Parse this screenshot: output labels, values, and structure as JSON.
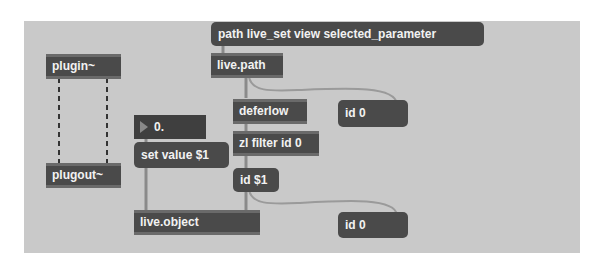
{
  "patcher": {
    "background": "#c9c9c9",
    "object_color": "#4a4a4a",
    "text_color": "#f2f2f2",
    "objects": {
      "path_msg": {
        "label": "path live_set view selected_parameter",
        "kind": "message"
      },
      "live_path": {
        "label": "live.path",
        "kind": "object"
      },
      "plugin": {
        "label": "plugin~",
        "kind": "object"
      },
      "plugout": {
        "label": "plugout~",
        "kind": "object"
      },
      "number": {
        "label": "0.",
        "kind": "flonum"
      },
      "deferlow": {
        "label": "deferlow",
        "kind": "object"
      },
      "id0_top": {
        "label": "id 0",
        "kind": "message"
      },
      "zl_filter": {
        "label": "zl filter id 0",
        "kind": "object"
      },
      "set_value": {
        "label": "set value $1",
        "kind": "message"
      },
      "id_s1": {
        "label": "id $1",
        "kind": "message"
      },
      "live_object": {
        "label": "live.object",
        "kind": "object"
      },
      "id0_bottom": {
        "label": "id 0",
        "kind": "message"
      }
    }
  }
}
